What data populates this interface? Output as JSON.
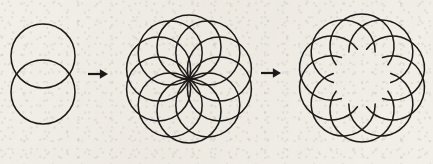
{
  "figure": {
    "background_color": "#f2efe9",
    "ink_color": "#1b1a18",
    "width": 433,
    "height": 164,
    "stroke_width": 1.5
  },
  "stages": [
    {
      "id": "stage-1",
      "name": "two-overlapping-circles",
      "label": "Two overlapping circles",
      "circle_count": 2,
      "radius": 32,
      "center": {
        "x": 43,
        "y": 74
      },
      "circles": [
        {
          "cx": 43,
          "cy": 56,
          "r": 32
        },
        {
          "cx": 43,
          "cy": 92,
          "r": 32
        }
      ]
    },
    {
      "id": "stage-2",
      "name": "full-rosette",
      "label": "Ten-circle rosette",
      "circle_count": 10,
      "radius": 32,
      "ring_radius": 32,
      "center": {
        "x": 189,
        "y": 79
      },
      "start_angle_deg": -90,
      "full_circles": true
    },
    {
      "id": "stage-3",
      "name": "pinwheel-rosette",
      "label": "Pinwheel with inner arcs removed",
      "circle_count": 10,
      "radius": 32,
      "ring_radius": 32,
      "center": {
        "x": 362,
        "y": 78
      },
      "start_angle_deg": -90,
      "arc_sweep_deg": 252,
      "arc_start_offset_deg": 54,
      "full_circles": false
    }
  ],
  "arrows": [
    {
      "id": "arrow-1",
      "name": "transform-arrow-1",
      "label": "becomes",
      "x1": 88,
      "y1": 74,
      "x2": 108,
      "y2": 74,
      "head_size": 6
    },
    {
      "id": "arrow-2",
      "name": "transform-arrow-2",
      "label": "becomes",
      "x1": 261,
      "y1": 73,
      "x2": 281,
      "y2": 73,
      "head_size": 6
    }
  ]
}
